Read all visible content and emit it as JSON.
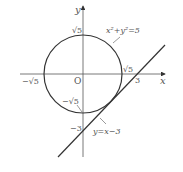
{
  "diagram": {
    "type": "coordinate-plane",
    "axes": {
      "x_label": "x",
      "y_label": "y",
      "origin_label": "O"
    },
    "circle": {
      "equation": "x²+y²=5",
      "radius_label": "√5",
      "neg_radius_label": "−√5"
    },
    "line": {
      "equation": "y=x−3",
      "x_intercept_label": "3",
      "y_intercept_label": "−3"
    },
    "tick_labels": {
      "y_top": "√5",
      "x_right": "√5",
      "x_left": "−√5",
      "y_bottom": "−√5",
      "x_three": "3",
      "y_neg_three": "−3"
    },
    "colors": {
      "stroke": "#333333",
      "text": "#555555"
    }
  }
}
